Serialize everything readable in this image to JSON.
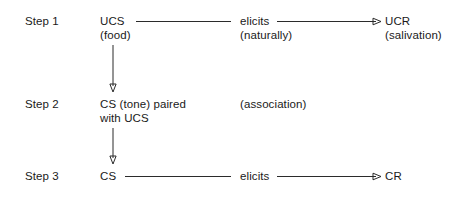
{
  "diagram": {
    "background_color": "#ffffff",
    "line_color": "#2b2b2b",
    "text_color": "#1a1a1a",
    "steps": [
      {
        "label": "Step 1",
        "stimulus": "UCS",
        "stimulus_sub": "(food)",
        "relation": "elicits",
        "relation_sub": "(naturally)",
        "response": "UCR",
        "response_sub": "(salivation)"
      },
      {
        "label": "Step 2",
        "stimulus_line1": "CS (tone) paired",
        "stimulus_line2": "with UCS",
        "relation": "(association)"
      },
      {
        "label": "Step 3",
        "stimulus": "CS",
        "relation": "elicits",
        "response": "CR"
      }
    ]
  }
}
